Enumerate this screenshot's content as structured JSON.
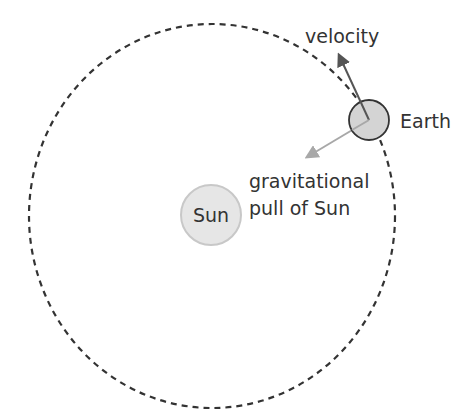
{
  "diagram": {
    "type": "orbit",
    "colors": {
      "background": "#ffffff",
      "orbit_stroke": "#333333",
      "sun_fill": "#e6e6e6",
      "sun_stroke": "#c8c8c8",
      "earth_fill": "#d4d4d4",
      "earth_stroke": "#333333",
      "velocity_arrow": "#555555",
      "gravity_arrow": "#a8a8a8",
      "text": "#333333"
    },
    "orbit": {
      "cx": 212,
      "cy": 216,
      "rx": 183,
      "ry": 192,
      "style": "dashed"
    },
    "sun": {
      "label": "Sun",
      "cx": 211,
      "cy": 215,
      "r": 30
    },
    "earth": {
      "label": "Earth",
      "cx": 369,
      "cy": 120,
      "r": 20
    },
    "vectors": [
      {
        "id": "velocity",
        "label": "velocity",
        "from": [
          369,
          120
        ],
        "to": [
          337,
          53
        ]
      },
      {
        "id": "gravity",
        "label_lines": [
          "gravitational",
          "pull of Sun"
        ],
        "from": [
          369,
          120
        ],
        "to": [
          305,
          158
        ]
      }
    ]
  }
}
